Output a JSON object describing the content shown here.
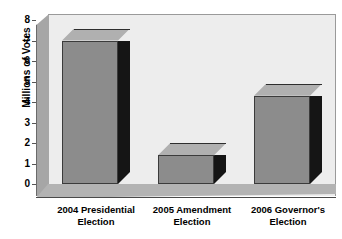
{
  "chart_data": {
    "type": "bar",
    "title": "",
    "subtitle": "",
    "xlabel": "",
    "ylabel": "Millions of Votes",
    "categories": [
      "2004 Presidential Election",
      "2005 Amendment Election",
      "2006 Governor's Election"
    ],
    "category_lines": [
      [
        "2004 Presidential",
        "Election"
      ],
      [
        "2005 Amendment",
        "Election"
      ],
      [
        "2006 Governor's",
        "Election"
      ]
    ],
    "values": [
      7.0,
      1.4,
      4.3
    ],
    "ylim": [
      0,
      8
    ],
    "yticks": [
      0,
      1,
      2,
      3,
      4,
      5,
      6,
      7,
      8
    ],
    "ytick_labels": [
      "0",
      "1",
      "2",
      "3",
      "4",
      "5",
      "6",
      "7",
      "8"
    ],
    "grid": false,
    "legend": false,
    "legend_position": "none",
    "style_3d": true,
    "units": "millions of votes"
  },
  "colors": {
    "plot_background": "#ededed",
    "page_background": "#ffffff",
    "bar_front": "#8c8c8c",
    "bar_top": "#b0b0b0",
    "bar_side": "#151515",
    "left_wall": "#a6a6a6",
    "floor": "#b3b3b3",
    "axis_line": "#4a4a4a",
    "text": "#000000"
  },
  "axis": {
    "y_title": "Millions of Votes"
  }
}
